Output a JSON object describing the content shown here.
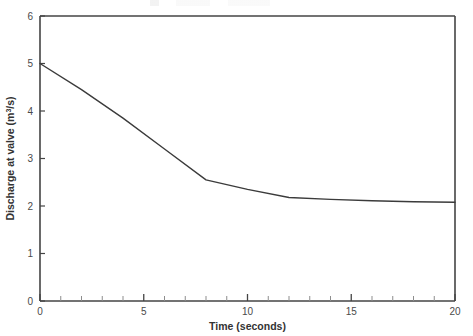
{
  "figure": {
    "background_color": "#ffffff",
    "axis_color": "#444444",
    "series_color": "#3b3b3b"
  },
  "chart_data": {
    "type": "line",
    "title": "",
    "subtitle": "",
    "xlabel": "Time (seconds)",
    "ylabel": "Discharge at valve (m3/s)",
    "ylabel_parts": {
      "prefix": "Discharge at valve (m",
      "superscript": "3",
      "suffix": "/s)"
    },
    "xlim": [
      0,
      20
    ],
    "ylim": [
      0,
      6
    ],
    "xticks": [
      0,
      5,
      10,
      15,
      20
    ],
    "xticklabels": [
      "0",
      "5",
      "10",
      "15",
      "20"
    ],
    "yticks": [
      0,
      1,
      2,
      3,
      4,
      5,
      6
    ],
    "yticklabels": [
      "0",
      "1",
      "2",
      "3",
      "4",
      "5",
      "6"
    ],
    "x_minor_tick_interval": 1,
    "grid": false,
    "legend": false,
    "legend_position": "none",
    "series": [
      {
        "name": "Discharge at valve",
        "color": "#3b3b3b",
        "line_width": 1.4,
        "marker": "none",
        "x": [
          0,
          2,
          4,
          6,
          8,
          10,
          12,
          14,
          16,
          18,
          20
        ],
        "y": [
          5.0,
          4.45,
          3.85,
          3.2,
          2.55,
          2.35,
          2.18,
          2.14,
          2.11,
          2.09,
          2.08
        ]
      }
    ],
    "annotations": []
  }
}
